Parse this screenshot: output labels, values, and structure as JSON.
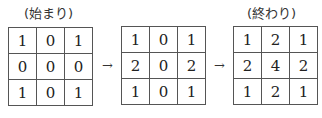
{
  "labels": {
    "start": "(始まり)",
    "end": "(終わり)"
  },
  "arrows": [
    "→",
    "→"
  ],
  "grids": {
    "start": [
      [
        "1",
        "0",
        "1"
      ],
      [
        "0",
        "0",
        "0"
      ],
      [
        "1",
        "0",
        "1"
      ]
    ],
    "middle": [
      [
        "1",
        "0",
        "1"
      ],
      [
        "2",
        "0",
        "2"
      ],
      [
        "1",
        "0",
        "1"
      ]
    ],
    "end": [
      [
        "1",
        "2",
        "1"
      ],
      [
        "2",
        "4",
        "2"
      ],
      [
        "1",
        "2",
        "1"
      ]
    ]
  }
}
